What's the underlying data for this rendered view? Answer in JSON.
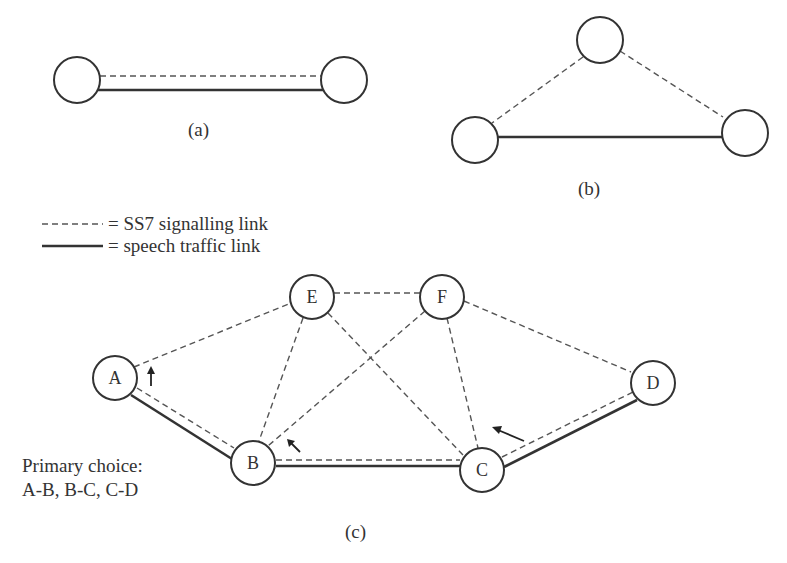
{
  "figure": {
    "panels": [
      {
        "id": "a",
        "caption": "(a)"
      },
      {
        "id": "b",
        "caption": "(b)"
      },
      {
        "id": "c",
        "caption": "(c)"
      }
    ],
    "legend": {
      "signalling": {
        "symbol": "------",
        "label": "= SS7 signalling link"
      },
      "speech": {
        "symbol": "———",
        "label": "= speech traffic link"
      }
    },
    "panel_c": {
      "nodes": [
        {
          "id": "A",
          "label": "A"
        },
        {
          "id": "B",
          "label": "B"
        },
        {
          "id": "C",
          "label": "C"
        },
        {
          "id": "D",
          "label": "D"
        },
        {
          "id": "E",
          "label": "E"
        },
        {
          "id": "F",
          "label": "F"
        }
      ],
      "signalling_links": [
        "A-E",
        "A-B",
        "E-F",
        "E-B",
        "E-C",
        "F-B",
        "F-C",
        "F-D",
        "B-C",
        "C-D"
      ],
      "speech_links": [
        "A-B",
        "B-C",
        "C-D"
      ],
      "note_line1": "Primary choice:",
      "note_line2": "A-B, B-C, C-D"
    },
    "colors": {
      "line": "#333333",
      "dashed": "#555555",
      "background": "#ffffff"
    }
  }
}
